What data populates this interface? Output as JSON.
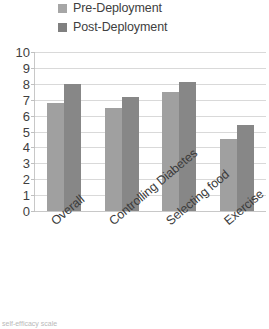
{
  "legend": {
    "position": "top-left",
    "items": [
      {
        "label": "Pre-Deployment",
        "swatch_color": "#a6a6a6",
        "swatch_icon": "legend-square-icon"
      },
      {
        "label": "Post-Deployment",
        "swatch_color": "#808080",
        "swatch_icon": "legend-square-icon"
      }
    ]
  },
  "axis": {
    "y_ticks": [
      "10",
      "9",
      "8",
      "7",
      "6",
      "5",
      "4",
      "3",
      "2",
      "1",
      "0"
    ],
    "x_ticks": [
      "Overall",
      "Controlling Diabetes",
      "Selecting food",
      "Exercise"
    ]
  },
  "footer": {
    "note": "self-efficacy scale"
  },
  "colors": {
    "pre_bar": "#a0a0a0",
    "post_bar": "#878787",
    "gridline": "#d9d9d9",
    "axis_line": "#c8c8c8",
    "text": "#3b3b3b"
  },
  "chart_data": {
    "type": "bar",
    "title": "",
    "subtitle": "",
    "xlabel": "",
    "ylabel": "",
    "categories": [
      "Overall",
      "Controlling Diabetes",
      "Selecting food",
      "Exercise"
    ],
    "series": [
      {
        "name": "Pre-Deployment",
        "color": "#a0a0a0",
        "values": [
          6.8,
          6.5,
          7.5,
          4.5
        ]
      },
      {
        "name": "Post-Deployment",
        "color": "#878787",
        "values": [
          8.0,
          7.2,
          8.1,
          5.4
        ]
      }
    ],
    "ylim": [
      0,
      10
    ],
    "ytick_step": 1,
    "grid": "horizontal",
    "legend_position": "top-left",
    "annotations": []
  }
}
